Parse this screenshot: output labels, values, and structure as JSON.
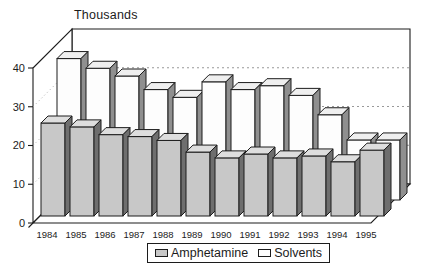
{
  "chart_data": {
    "type": "bar",
    "projection": "3d",
    "title": "",
    "ylabel": "Thousands",
    "xlabel": "",
    "ylim": [
      0,
      40
    ],
    "yticks": [
      0,
      10,
      20,
      30,
      40
    ],
    "grid": "dashed-horizontal-on-back-wall",
    "legend_position": "bottom-center",
    "categories": [
      "1984",
      "1985",
      "1986",
      "1987",
      "1988",
      "1989",
      "1990",
      "1991",
      "1992",
      "1993",
      "1994",
      "1995"
    ],
    "series": [
      {
        "name": "Amphetamine",
        "row": "front",
        "color": "#c8c8c8",
        "top_color": "#dedede",
        "side_color": "#6e6e6e",
        "values": [
          24,
          23,
          21,
          20.5,
          19.5,
          16.5,
          15,
          16,
          15,
          15.5,
          14,
          17
        ]
      },
      {
        "name": "Solvents",
        "row": "back",
        "color": "#fdfdfd",
        "top_color": "#efefef",
        "side_color": "#8f8f8f",
        "values": [
          36.5,
          34,
          32,
          28.5,
          26.5,
          30.5,
          28.5,
          29.5,
          27,
          22,
          15.5,
          15.5
        ]
      }
    ]
  },
  "colors": {
    "outline": "#1c1c1c",
    "wall_fill": "#ffffff",
    "gridline": "#999999",
    "background": "#ffffff"
  }
}
